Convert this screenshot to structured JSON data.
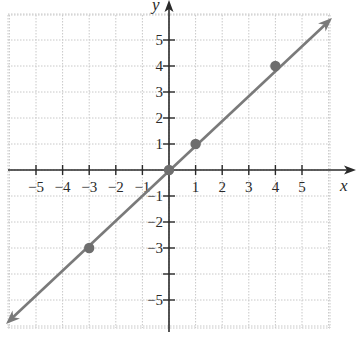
{
  "chart_data": {
    "type": "line",
    "title": "",
    "xlabel": "x",
    "ylabel": "y",
    "xlim": [
      -6,
      6
    ],
    "ylim": [
      -6,
      6
    ],
    "grid": true,
    "x_ticks": [
      -5,
      -4,
      -3,
      -2,
      -1,
      1,
      2,
      3,
      4,
      5
    ],
    "x_tick_labels": [
      "−5",
      "−4",
      "−3",
      "−2",
      "−1",
      "1",
      "2",
      "3",
      "4",
      "5"
    ],
    "y_ticks": [
      -5,
      -4,
      -3,
      -2,
      -1,
      1,
      2,
      3,
      4,
      5
    ],
    "y_tick_labels": [
      "−5",
      "",
      "−3",
      "−2",
      "−1",
      "1",
      "2",
      "3",
      "4",
      "5"
    ],
    "series": [
      {
        "name": "y = x",
        "equation": "y = x",
        "line_color": "#7a7a7a",
        "arrows": "both",
        "x": [
          -6.0,
          6.0
        ],
        "y": [
          -6.0,
          6.0
        ]
      }
    ],
    "points": [
      {
        "x": -3,
        "y": -3
      },
      {
        "x": 0,
        "y": 0
      },
      {
        "x": 1,
        "y": 1
      },
      {
        "x": 4,
        "y": 4
      }
    ],
    "colors": {
      "axis": "#2a2a2a",
      "grid": "#c8c8c8",
      "line": "#7a7a7a",
      "point": "#6e6e6e"
    }
  }
}
